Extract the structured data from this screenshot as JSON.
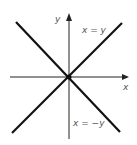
{
  "diagram": {
    "axes": {
      "x_label": "x",
      "y_label": "y",
      "color": "#111111"
    },
    "lines": [
      {
        "label": "x = y",
        "color": "#111111"
      },
      {
        "label": "x = −y",
        "color": "#111111"
      }
    ]
  }
}
